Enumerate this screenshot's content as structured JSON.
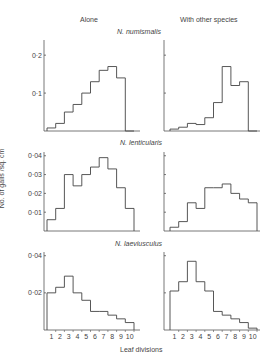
{
  "headers": {
    "left": "Alone",
    "right": "With other species"
  },
  "ylabel": "No. of galls /sq. cm",
  "xlabel": "Leaf divisions",
  "chart_data": [
    {
      "type": "bar",
      "title": "N. numismalis",
      "xlabel": "Leaf divisions",
      "ylabel": "No. of galls /sq. cm",
      "categories": [
        1,
        2,
        3,
        4,
        5,
        6,
        7,
        8,
        9,
        10
      ],
      "series": [
        {
          "name": "Alone",
          "values": [
            0.008,
            0.02,
            0.05,
            0.07,
            0.1,
            0.13,
            0.16,
            0.17,
            0.14,
            0
          ]
        },
        {
          "name": "With other species",
          "values": [
            0.005,
            0.01,
            0.02,
            0.017,
            0.035,
            0.075,
            0.17,
            0.12,
            0.13,
            0
          ]
        }
      ],
      "yticks": [
        0.1,
        0.2
      ],
      "ytick_labels": [
        "0·1",
        "0·2"
      ],
      "ylim": [
        0,
        0.24
      ]
    },
    {
      "type": "bar",
      "title": "N. lenticularis",
      "xlabel": "Leaf divisions",
      "ylabel": "No. of galls /sq. cm",
      "categories": [
        1,
        2,
        3,
        4,
        5,
        6,
        7,
        8,
        9,
        10
      ],
      "series": [
        {
          "name": "Alone",
          "values": [
            0.006,
            0.012,
            0.03,
            0.024,
            0.03,
            0.034,
            0.039,
            0.033,
            0.023,
            0.012
          ]
        },
        {
          "name": "With other species",
          "values": [
            0.002,
            0.005,
            0.015,
            0.012,
            0.023,
            0.023,
            0.025,
            0.02,
            0.017,
            0.015
          ]
        }
      ],
      "yticks": [
        0.01,
        0.02,
        0.03,
        0.04
      ],
      "ytick_labels": [
        "0·01",
        "0·02",
        "0·03",
        "0·04"
      ],
      "ylim": [
        0,
        0.042
      ]
    },
    {
      "type": "bar",
      "title": "N. laeviusculus",
      "xlabel": "Leaf divisions",
      "ylabel": "No. of galls /sq. cm",
      "categories": [
        1,
        2,
        3,
        4,
        5,
        6,
        7,
        8,
        9,
        10
      ],
      "series": [
        {
          "name": "Alone",
          "values": [
            0.02,
            0.023,
            0.029,
            0.02,
            0.016,
            0.01,
            0.01,
            0.008,
            0.006,
            0.004
          ]
        },
        {
          "name": "With other species",
          "values": [
            0.021,
            0.026,
            0.037,
            0.026,
            0.021,
            0.01,
            0.008,
            0.006,
            0.004,
            0.001
          ]
        }
      ],
      "yticks": [
        0.02,
        0.04
      ],
      "ytick_labels": [
        "0·02",
        "0·04"
      ],
      "ylim": [
        0,
        0.042
      ]
    }
  ]
}
